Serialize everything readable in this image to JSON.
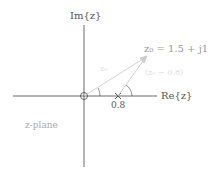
{
  "diagram": {
    "im_axis_label": "Im{z}",
    "re_axis_label": "Re{z}",
    "plane_label": "z-plane",
    "point_label": "z₀ = 1.5 + j1",
    "zero_point_label": "0.8",
    "vector_label_1": "z₀",
    "vector_label_2": "(z₀ − 0.8)",
    "colors": {
      "axis": "#444444",
      "vector": "#cccccc",
      "text": "#555555"
    }
  }
}
